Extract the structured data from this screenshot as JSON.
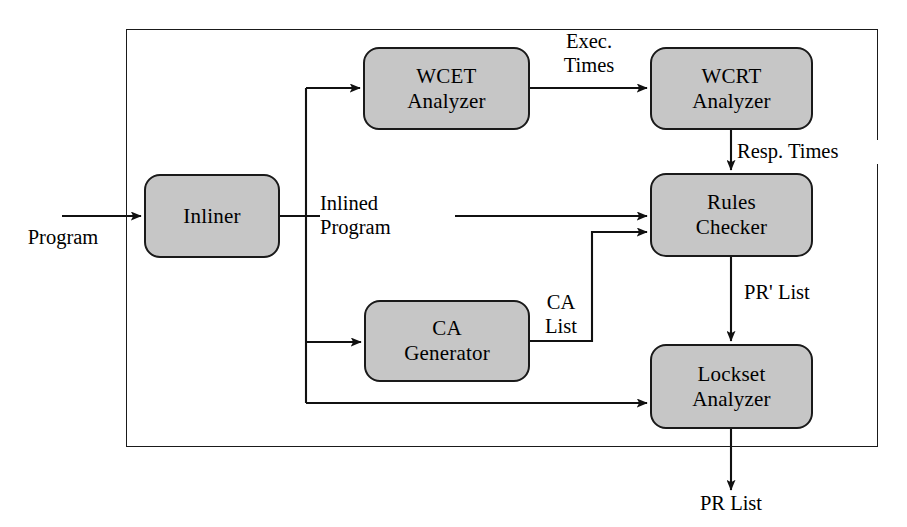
{
  "diagram": {
    "colors": {
      "node_fill": "#c6c6c6",
      "stroke": "#1a1a1a",
      "background": "#ffffff"
    },
    "nodes": [
      {
        "id": "inliner",
        "line1": "Inliner",
        "line2": ""
      },
      {
        "id": "wcet",
        "line1": "WCET",
        "line2": "Analyzer"
      },
      {
        "id": "wcrt",
        "line1": "WCRT",
        "line2": "Analyzer"
      },
      {
        "id": "rules",
        "line1": "Rules",
        "line2": "Checker"
      },
      {
        "id": "ca",
        "line1": "CA",
        "line2": "Generator"
      },
      {
        "id": "lockset",
        "line1": "Lockset",
        "line2": "Analyzer"
      }
    ],
    "edge_labels": [
      {
        "id": "program",
        "line1": "Program",
        "line2": ""
      },
      {
        "id": "exec-times",
        "line1": "Exec.",
        "line2": "Times"
      },
      {
        "id": "resp-times",
        "line1": "Resp. Times",
        "line2": ""
      },
      {
        "id": "inlined-program",
        "line1": "Inlined",
        "line2": "Program"
      },
      {
        "id": "ca-list",
        "line1": "CA",
        "line2": "List"
      },
      {
        "id": "pr-prime-list",
        "line1": "PR' List",
        "line2": ""
      },
      {
        "id": "pr-list",
        "line1": "PR List",
        "line2": ""
      }
    ]
  }
}
